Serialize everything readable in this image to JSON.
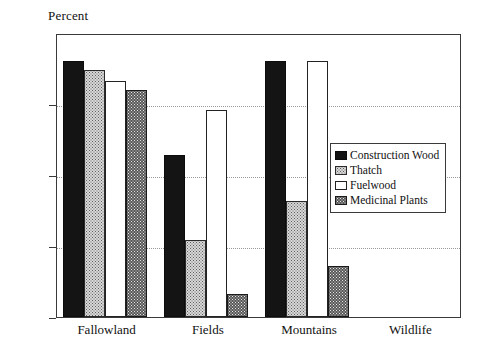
{
  "chart_data": {
    "type": "bar",
    "title": "",
    "ylabel": "Percent",
    "xlabel": "",
    "ylim": [
      0,
      100
    ],
    "yticks": [
      0,
      25,
      50,
      75,
      100
    ],
    "grid": true,
    "legend_position": "inside-right",
    "categories": [
      "Fallowland",
      "Fields",
      "Mountains",
      "Wildlife"
    ],
    "series": [
      {
        "name": "Construction Wood",
        "key": "construction",
        "values": [
          90,
          57,
          90,
          0
        ]
      },
      {
        "name": "Thatch",
        "key": "thatch",
        "values": [
          87,
          27,
          41,
          0
        ]
      },
      {
        "name": "Fuelwood",
        "key": "fuelwood",
        "values": [
          83,
          73,
          90,
          0
        ]
      },
      {
        "name": "Medicinal Plants",
        "key": "medicinal",
        "values": [
          80,
          8,
          18,
          0
        ]
      }
    ]
  },
  "legend": {
    "items": [
      {
        "label": "Construction Wood",
        "swatch": "solid-black-swatch"
      },
      {
        "label": "Thatch",
        "swatch": "light-dotted-swatch"
      },
      {
        "label": "Fuelwood",
        "swatch": "white-swatch"
      },
      {
        "label": "Medicinal Plants",
        "swatch": "dark-dotted-swatch"
      }
    ]
  },
  "axis": {
    "y_title": "Percent",
    "y_tick_labels": [
      "0",
      "25",
      "50",
      "75",
      "100"
    ]
  }
}
